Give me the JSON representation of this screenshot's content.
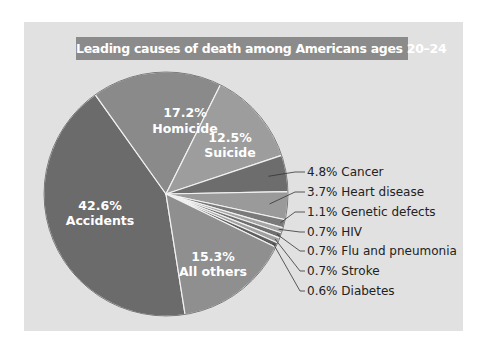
{
  "chart_data": {
    "type": "pie",
    "title": "Leading causes of death among  Americans ages 20–24",
    "slices": [
      {
        "label": "Accidents",
        "value": 42.6,
        "display": "42.6%",
        "color": "#6b6b6b"
      },
      {
        "label": "Homicide",
        "value": 17.2,
        "display": "17.2%",
        "color": "#8a8a8a"
      },
      {
        "label": "Suicide",
        "value": 12.5,
        "display": "12.5%",
        "color": "#9d9d9d"
      },
      {
        "label": "Cancer",
        "value": 4.8,
        "display": "4.8%",
        "color": "#6d6d6d"
      },
      {
        "label": "Heart disease",
        "value": 3.7,
        "display": "3.7%",
        "color": "#9a9a9a"
      },
      {
        "label": "Genetic defects",
        "value": 1.1,
        "display": "1.1%",
        "color": "#7a7a7a"
      },
      {
        "label": "HIV",
        "value": 0.7,
        "display": "0.7%",
        "color": "#a5a5a5"
      },
      {
        "label": "Flu and pneumonia",
        "value": 0.7,
        "display": "0.7%",
        "color": "#6f6f6f"
      },
      {
        "label": "Stroke",
        "value": 0.7,
        "display": "0.7%",
        "color": "#a0a0a0"
      },
      {
        "label": "Diabetes",
        "value": 0.6,
        "display": "0.6%",
        "color": "#5e5e5e"
      },
      {
        "label": "All others",
        "value": 15.3,
        "display": "15.3%",
        "color": "#8f8f8f"
      }
    ],
    "legend_position": "callouts-right",
    "grid": false
  },
  "labels": {
    "title": "Leading causes of death among  Americans ages 20–24",
    "inside": {
      "accidents": {
        "pct": "42.6%",
        "name": "Accidents"
      },
      "homicide": {
        "pct": "17.2%",
        "name": "Homicide"
      },
      "suicide": {
        "pct": "12.5%",
        "name": "Suicide"
      },
      "all_others": {
        "pct": "15.3%",
        "name": "All others"
      }
    },
    "callouts": [
      "4.8% Cancer",
      "3.7% Heart disease",
      "1.1% Genetic defects",
      "0.7% HIV",
      "0.7% Flu and pneumonia",
      "0.7% Stroke",
      "0.6% Diabetes"
    ]
  },
  "colors": {
    "panel_bg": "#e1e1e1",
    "title_bar": "#8b8b8b",
    "divider": "#f2f2f2"
  }
}
